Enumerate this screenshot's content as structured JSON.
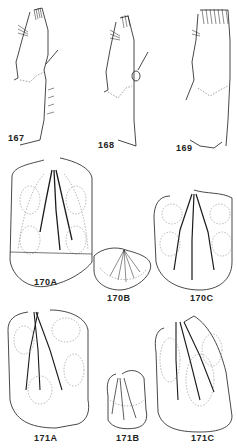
{
  "figure": {
    "labels": {
      "f167": "167",
      "f168": "168",
      "f169": "169",
      "f170A": "170A",
      "f170B": "170B",
      "f170C": "170C",
      "f171A": "171A",
      "f171B": "171B",
      "f171C": "171C"
    },
    "colors": {
      "ink": "#1a1a1a",
      "faint": "#888888",
      "background": "#ffffff"
    }
  }
}
